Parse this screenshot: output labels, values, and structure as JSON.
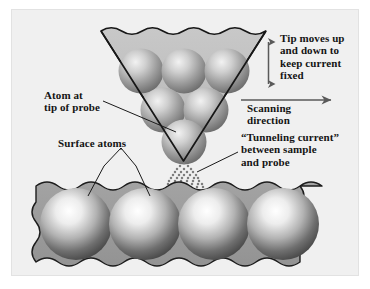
{
  "figure": {
    "background_color": "#f0f0f0",
    "page_color": "#ffffff",
    "ink_color": "#141414",
    "slab_color": "#9b9b9b",
    "probe_color": "#bdbdbd"
  },
  "labels": {
    "tip_moves": "Tip moves up\nand down to\nkeep current\nfixed",
    "scanning_direction": "Scanning\ndirection",
    "tunneling_current": "“Tunneling current”\nbetween sample\nand probe",
    "atom_at_tip": "Atom at\ntip of probe",
    "surface_atoms": "Surface atoms"
  },
  "arrows": {
    "vertical": {
      "name": "up-down-arrow",
      "direction": "both",
      "orientation": "vertical"
    },
    "horizontal": {
      "name": "right-arrow",
      "direction": "right",
      "orientation": "horizontal"
    }
  },
  "diagram_parts": {
    "probe": {
      "name": "probe-tip",
      "shape": "inverted-triangle-with-wavy-top",
      "atom_count": 6,
      "atom_rows": [
        3,
        2,
        1
      ]
    },
    "sample": {
      "name": "sample-surface",
      "shape": "wavy-slab",
      "atom_count": 4
    },
    "tunneling_beam": {
      "name": "tunneling-current-dots",
      "shape": "dot-fan"
    }
  }
}
